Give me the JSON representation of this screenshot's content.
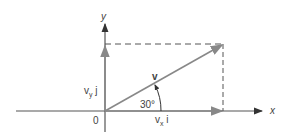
{
  "diagram": {
    "axes": {
      "x_label": "x",
      "y_label": "y",
      "origin_label": "0"
    },
    "vector": {
      "label": "v",
      "angle_label": "30°"
    },
    "components": {
      "vx": {
        "base": "v",
        "sub": "x",
        "unit": " i"
      },
      "vy": {
        "base": "v",
        "sub": "y",
        "unit": " j"
      }
    },
    "colors": {
      "axis": "#333333",
      "vector": "#777777",
      "dashed": "#555555"
    }
  }
}
